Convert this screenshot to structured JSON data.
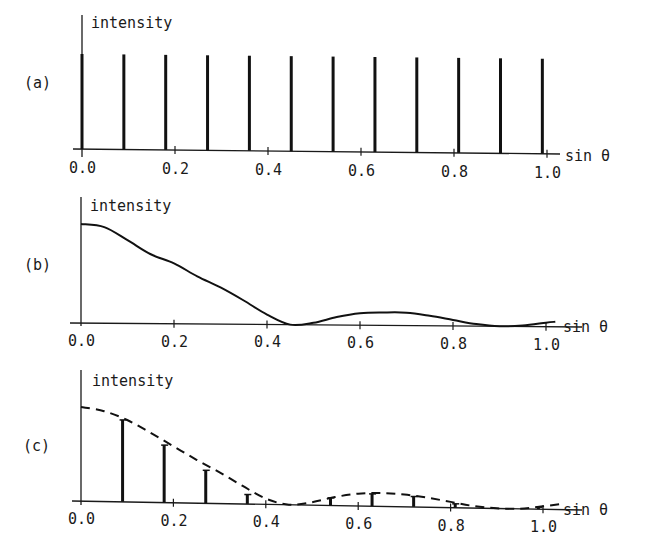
{
  "chart_data": [
    {
      "panel": "(a)",
      "type": "bar",
      "title": "",
      "ylabel": "intensity",
      "xlabel": "sin θ",
      "x_ticks": [
        0.0,
        0.2,
        0.4,
        0.6,
        0.8,
        1.0
      ],
      "x_tick_labels": [
        "0.0",
        "0.2",
        "0.4",
        "0.6",
        "0.8",
        "1.0"
      ],
      "xlim": [
        0.0,
        1.08
      ],
      "ylim": [
        0,
        1.15
      ],
      "grid": false,
      "series": [
        {
          "name": "lattice reflections",
          "style": "spikes",
          "x": [
            0.0,
            0.09,
            0.18,
            0.27,
            0.36,
            0.45,
            0.54,
            0.63,
            0.72,
            0.81,
            0.9,
            0.99
          ],
          "values": [
            1.0,
            1.0,
            1.0,
            1.0,
            1.0,
            1.0,
            1.0,
            1.0,
            1.0,
            1.0,
            1.0,
            1.0
          ]
        }
      ]
    },
    {
      "panel": "(b)",
      "type": "line",
      "title": "",
      "ylabel": "intensity",
      "xlabel": "sin θ",
      "x_ticks": [
        0.0,
        0.2,
        0.4,
        0.6,
        0.8,
        1.0
      ],
      "x_tick_labels": [
        "0.0",
        "0.2",
        "0.4",
        "0.6",
        "0.8",
        "1.0"
      ],
      "xlim": [
        0.0,
        1.08
      ],
      "ylim": [
        0,
        1.25
      ],
      "grid": false,
      "series": [
        {
          "name": "molecular transform",
          "style": "solid",
          "x": [
            0.0,
            0.05,
            0.1,
            0.15,
            0.2,
            0.25,
            0.3,
            0.35,
            0.4,
            0.45,
            0.5,
            0.55,
            0.6,
            0.65,
            0.7,
            0.75,
            0.8,
            0.85,
            0.9,
            0.95,
            1.0,
            1.02
          ],
          "values": [
            1.0,
            0.97,
            0.84,
            0.7,
            0.61,
            0.48,
            0.37,
            0.24,
            0.1,
            0.0,
            0.02,
            0.08,
            0.12,
            0.13,
            0.13,
            0.1,
            0.06,
            0.02,
            0.0,
            0.01,
            0.04,
            0.05
          ]
        }
      ]
    },
    {
      "panel": "(c)",
      "type": "bar",
      "title": "",
      "ylabel": "intensity",
      "xlabel": "sin θ",
      "x_ticks": [
        0.0,
        0.2,
        0.4,
        0.6,
        0.8,
        1.0
      ],
      "x_tick_labels": [
        "0.0",
        "0.2",
        "0.4",
        "0.6",
        "0.8",
        "1.0"
      ],
      "xlim": [
        0.0,
        1.08
      ],
      "ylim": [
        0,
        1.25
      ],
      "grid": false,
      "series": [
        {
          "name": "envelope (molecular transform)",
          "style": "dashed",
          "x": [
            0.0,
            0.05,
            0.1,
            0.15,
            0.2,
            0.25,
            0.3,
            0.35,
            0.4,
            0.45,
            0.5,
            0.55,
            0.6,
            0.65,
            0.7,
            0.75,
            0.8,
            0.85,
            0.9,
            0.95,
            1.0,
            1.04
          ],
          "values": [
            1.0,
            0.96,
            0.87,
            0.74,
            0.6,
            0.46,
            0.33,
            0.19,
            0.06,
            0.0,
            0.03,
            0.09,
            0.13,
            0.14,
            0.13,
            0.1,
            0.06,
            0.02,
            0.0,
            0.0,
            0.03,
            0.06
          ]
        },
        {
          "name": "sampled reflections",
          "style": "spikes",
          "x": [
            0.09,
            0.18,
            0.27,
            0.36,
            0.54,
            0.63,
            0.72,
            0.81,
            0.99
          ],
          "values": [
            0.87,
            0.61,
            0.35,
            0.1,
            0.08,
            0.13,
            0.11,
            0.04,
            0.02
          ]
        }
      ]
    }
  ],
  "panels": {
    "a": {
      "label": "(a)",
      "ylabel": "intensity",
      "xlabel": "sin θ"
    },
    "b": {
      "label": "(b)",
      "ylabel": "intensity",
      "xlabel": "sin θ"
    },
    "c": {
      "label": "(c)",
      "ylabel": "intensity",
      "xlabel": "sin θ"
    }
  },
  "tick_labels": [
    "0.0",
    "0.2",
    "0.4",
    "0.6",
    "0.8",
    "1.0"
  ]
}
